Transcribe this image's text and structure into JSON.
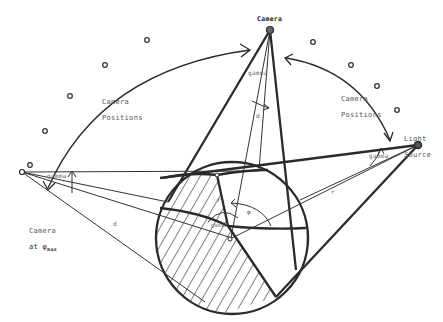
{
  "diagram": {
    "labels": {
      "camera_top": "Camera",
      "camera_positions_left_1": "Camera",
      "camera_positions_left_2": "Positions",
      "camera_positions_right_1": "Camera",
      "camera_positions_right_2": "Positions",
      "light_source_1": "Light",
      "light_source_2": "Source",
      "camera_max_1": "Camera",
      "camera_max_2": "at φ",
      "camera_max_sub": "max",
      "gamma_top": "gamma",
      "gamma_right": "gamma",
      "gamma_left": "gamma",
      "gamma_center": "gamma",
      "d_vertical": "d",
      "d_left": "d",
      "r_right": "r",
      "r_center": "r",
      "phi_center": "φ"
    },
    "colors": {
      "stroke": "#2a2a2a",
      "thin_stroke": "#333333",
      "hatch": "#3a3a3a",
      "text": "#555555",
      "background": "#ffffff"
    }
  }
}
